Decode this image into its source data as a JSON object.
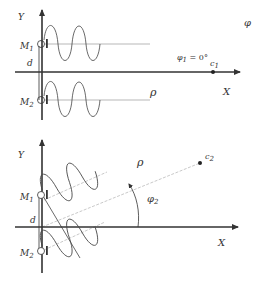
{
  "figure": {
    "top_panel": {
      "y_axis_label": "Y",
      "x_axis_label": "X",
      "mic1_label": "M",
      "mic1_sub": "1",
      "mic2_label": "M",
      "mic2_sub": "2",
      "spacing_label": "d",
      "distance_label": "ρ",
      "angle_label": "φ",
      "angle_value_label": "φ",
      "angle_value_sub": "1",
      "angle_value_text": " = 0°",
      "source_label": "c",
      "source_sub": "1"
    },
    "bottom_panel": {
      "y_axis_label": "Y",
      "x_axis_label": "X",
      "mic1_label": "M",
      "mic1_sub": "1",
      "mic2_label": "M",
      "mic2_sub": "2",
      "spacing_label": "d",
      "distance_label": "ρ",
      "angle_label": "φ",
      "angle_sub": "2",
      "source_label": "c",
      "source_sub": "2"
    },
    "colors": {
      "axis": "#333333",
      "wave": "#444444",
      "ray": "#bbbbbb",
      "text": "#333333"
    }
  }
}
